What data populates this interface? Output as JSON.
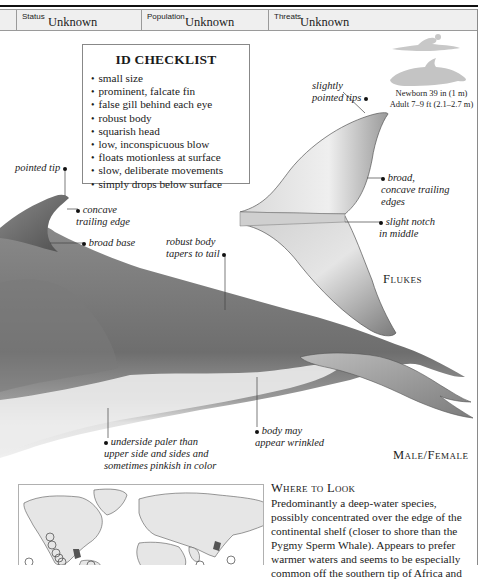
{
  "status_bar": {
    "items": [
      {
        "label": "Status",
        "value": "Unknown"
      },
      {
        "label": "Population",
        "value": "Unknown"
      },
      {
        "label": "Threats",
        "value": "Unknown"
      }
    ]
  },
  "id_checklist": {
    "title": "ID CHECKLIST",
    "items": [
      "small size",
      "prominent, falcate fin",
      "false gill behind each eye",
      "robust body",
      "squarish head",
      "low, inconspicuous blow",
      "floats motionless at surface",
      "slow, deliberate movements",
      "simply drops below surface"
    ]
  },
  "size_comparison": {
    "icons": [
      "human-swimmer-silhouette-icon",
      "whale-silhouette-icon"
    ],
    "newborn": "Newborn 39 in (1 m)",
    "adult": "Adult 7–9 ft (2.1–2.7 m)"
  },
  "annotations": {
    "pointed_tip": "pointed tip",
    "concave_trailing_edge_1": "concave",
    "concave_trailing_edge_2": "trailing edge",
    "broad_base": "broad base",
    "robust_body_1": "robust body",
    "robust_body_2": "tapers to tail",
    "underside_1": "underside paler than",
    "underside_2": "upper side and sides and",
    "underside_3": "sometimes pinkish in color",
    "wrinkled_1": "body may",
    "wrinkled_2": "appear wrinkled",
    "slightly_pointed_1": "slightly",
    "slightly_pointed_2": "pointed tips",
    "broad_concave_1": "broad,",
    "broad_concave_2": "concave trailing",
    "broad_concave_3": "edges",
    "notch_1": "slight notch",
    "notch_2": "in middle"
  },
  "captions": {
    "flukes": "Flukes",
    "main": "Male/Female"
  },
  "where_to_look": {
    "heading": "Where to Look",
    "body": "Predominantly a deep-water species, possibly concentrated over the edge of the continental shelf (closer to shore than the Pygmy Sperm Whale). Appears to prefer warmer waters and seems to be especially common off the southern tip of Africa and"
  },
  "colors": {
    "header_band": "#efefef",
    "whale_dark": "#6b6b6b",
    "whale_light": "#e4e4e4",
    "map_land": "#e6e6e6"
  }
}
